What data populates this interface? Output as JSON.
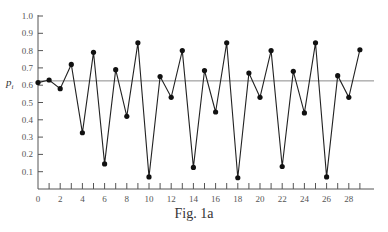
{
  "chart_data": {
    "type": "line",
    "title": "",
    "caption": "Fig. 1a",
    "xlabel": "",
    "ylabel": "p_i",
    "ylabel_main": "p",
    "ylabel_sub": "i",
    "xlim": [
      0,
      30
    ],
    "ylim": [
      0,
      1.0
    ],
    "x_tick_labels": [
      "0",
      "2",
      "4",
      "6",
      "8",
      "10",
      "12",
      "14",
      "16",
      "18",
      "20",
      "22",
      "24",
      "26",
      "28"
    ],
    "x_minor_ticks": [
      1,
      2,
      3,
      4,
      5,
      6,
      7,
      8,
      9,
      10,
      11,
      12,
      13,
      14,
      15,
      16,
      17,
      18,
      19,
      20,
      21,
      22,
      23,
      24,
      25,
      26,
      27,
      28,
      29
    ],
    "y_tick_labels": [
      "0.1",
      "0.2",
      "0.3",
      "0.4",
      "0.5",
      "0.6",
      "0.7",
      "0.8",
      "0.9",
      "1.0"
    ],
    "grid": false,
    "legend": null,
    "reference_line": {
      "y": 0.625,
      "label": ""
    },
    "series": [
      {
        "name": "p_i",
        "x": [
          0,
          1,
          2,
          3,
          4,
          5,
          6,
          7,
          8,
          9,
          10,
          11,
          12,
          13,
          14,
          15,
          16,
          17,
          18,
          19,
          20,
          21,
          22,
          23,
          24,
          25,
          26,
          27,
          28,
          29
        ],
        "values": [
          0.615,
          0.63,
          0.58,
          0.72,
          0.325,
          0.79,
          0.145,
          0.69,
          0.42,
          0.845,
          0.07,
          0.65,
          0.53,
          0.8,
          0.125,
          0.685,
          0.445,
          0.845,
          0.065,
          0.67,
          0.53,
          0.8,
          0.13,
          0.68,
          0.44,
          0.845,
          0.07,
          0.655,
          0.53,
          0.805
        ]
      }
    ]
  },
  "colors": {
    "line": "#222222",
    "marker": "#111111",
    "axis": "#555555",
    "reference": "#8a8a8a",
    "background": "#ffffff"
  }
}
